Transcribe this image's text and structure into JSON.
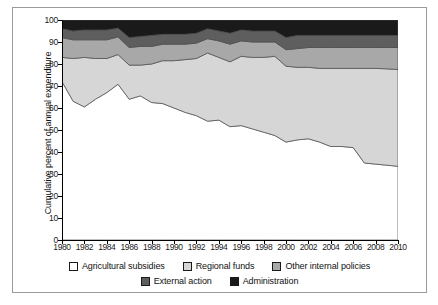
{
  "chart_data": {
    "type": "area",
    "stacked": true,
    "cumulative": true,
    "title": "",
    "xlabel": "",
    "ylabel": "Cumulative percent of annual expenditure",
    "ylim": [
      0,
      100
    ],
    "ytick_step": 10,
    "yticks": [
      0,
      10,
      20,
      30,
      40,
      50,
      60,
      70,
      80,
      90,
      100
    ],
    "xlim": [
      1980,
      2010
    ],
    "xtick_step": 2,
    "xticks": [
      1980,
      1982,
      1984,
      1986,
      1988,
      1990,
      1992,
      1994,
      1996,
      1998,
      2000,
      2002,
      2004,
      2006,
      2008,
      2010
    ],
    "grid": false,
    "legend_position": "bottom",
    "x": [
      1980,
      1981,
      1982,
      1983,
      1984,
      1985,
      1986,
      1987,
      1988,
      1989,
      1990,
      1991,
      1992,
      1993,
      1994,
      1995,
      1996,
      1997,
      1998,
      1999,
      2000,
      2001,
      2002,
      2003,
      2004,
      2005,
      2006,
      2007,
      2008,
      2009,
      2010
    ],
    "series": [
      {
        "name": "Agricultural subsidies",
        "color": "#ffffff",
        "values": [
          72.0,
          63.0,
          60.5,
          64.0,
          67.0,
          70.8,
          64.0,
          65.5,
          62.5,
          62.0,
          60.0,
          58.0,
          56.5,
          54.0,
          54.5,
          51.5,
          52.0,
          50.5,
          49.0,
          47.5,
          44.5,
          45.5,
          46.0,
          44.5,
          42.5,
          42.5,
          42.0,
          35.0,
          34.5,
          34.0,
          33.5
        ]
      },
      {
        "name": "Regional funds",
        "color": "#d6d6d6",
        "values": [
          11.0,
          19.5,
          22.5,
          18.5,
          15.5,
          13.5,
          15.5,
          14.0,
          17.5,
          19.5,
          21.5,
          24.0,
          26.0,
          31.0,
          28.5,
          29.5,
          31.5,
          32.5,
          34.0,
          36.0,
          34.5,
          33.0,
          32.5,
          33.5,
          35.5,
          35.5,
          36.0,
          43.0,
          43.5,
          43.8,
          44.0
        ]
      },
      {
        "name": "Other internal policies",
        "color": "#a8a8a8",
        "values": [
          9.0,
          8.5,
          8.0,
          8.5,
          8.5,
          8.0,
          8.0,
          8.5,
          8.0,
          7.5,
          7.5,
          7.0,
          7.0,
          6.5,
          7.5,
          8.0,
          7.0,
          7.0,
          7.0,
          6.5,
          7.5,
          8.5,
          9.0,
          9.5,
          9.5,
          9.5,
          9.5,
          9.5,
          9.5,
          9.7,
          10.0
        ]
      },
      {
        "name": "External action",
        "color": "#5e5e5e",
        "values": [
          4.0,
          4.0,
          4.5,
          4.5,
          4.5,
          4.0,
          4.5,
          4.5,
          5.0,
          4.5,
          4.5,
          4.5,
          4.5,
          4.5,
          4.5,
          5.0,
          5.0,
          5.0,
          5.0,
          5.0,
          5.5,
          6.0,
          5.5,
          5.5,
          5.5,
          5.5,
          5.5,
          5.5,
          5.5,
          5.5,
          5.5
        ]
      },
      {
        "name": "Administration",
        "color": "#1a1a1a",
        "values": [
          4.0,
          5.0,
          4.5,
          4.5,
          4.5,
          3.7,
          8.0,
          7.5,
          7.0,
          6.5,
          6.5,
          6.5,
          6.0,
          4.0,
          5.0,
          6.0,
          4.5,
          5.0,
          5.0,
          5.0,
          8.0,
          7.0,
          7.0,
          7.0,
          7.0,
          7.0,
          7.0,
          7.0,
          7.0,
          7.0,
          7.0
        ]
      }
    ],
    "cumulative_boundaries": {
      "agricultural_subsidies_top": [
        72.0,
        63.0,
        60.5,
        64.0,
        67.0,
        70.8,
        64.0,
        65.5,
        62.5,
        62.0,
        60.0,
        58.0,
        56.5,
        54.0,
        54.5,
        51.5,
        52.0,
        50.5,
        49.0,
        47.5,
        44.5,
        45.5,
        46.0,
        44.5,
        42.5,
        42.5,
        42.0,
        35.0,
        34.5,
        34.0,
        33.5
      ],
      "regional_funds_top": [
        83.0,
        82.5,
        83.0,
        82.5,
        82.5,
        84.3,
        79.5,
        79.5,
        80.0,
        81.5,
        81.5,
        82.0,
        82.5,
        85.0,
        83.0,
        81.0,
        83.5,
        83.0,
        83.0,
        83.5,
        79.0,
        78.5,
        78.5,
        78.0,
        78.0,
        78.0,
        78.0,
        78.0,
        78.0,
        77.8,
        77.5
      ],
      "other_internal_policies_top": [
        92.0,
        91.0,
        91.0,
        91.0,
        91.0,
        92.3,
        87.5,
        88.0,
        88.0,
        89.0,
        89.0,
        89.0,
        89.5,
        91.5,
        90.5,
        89.0,
        90.5,
        90.0,
        90.0,
        90.0,
        86.5,
        87.0,
        87.5,
        87.5,
        87.5,
        87.5,
        87.5,
        87.5,
        87.5,
        87.5,
        87.5
      ],
      "external_action_top": [
        96.0,
        95.0,
        95.5,
        95.5,
        95.5,
        96.3,
        92.0,
        92.5,
        93.0,
        93.5,
        93.5,
        93.5,
        94.0,
        96.0,
        95.0,
        94.0,
        95.5,
        95.0,
        95.0,
        95.0,
        92.0,
        93.0,
        93.0,
        93.0,
        93.0,
        93.0,
        93.0,
        93.0,
        93.0,
        93.0,
        93.0
      ],
      "administration_top": [
        100,
        100,
        100,
        100,
        100,
        100,
        100,
        100,
        100,
        100,
        100,
        100,
        100,
        100,
        100,
        100,
        100,
        100,
        100,
        100,
        100,
        100,
        100,
        100,
        100,
        100,
        100,
        100,
        100,
        100,
        100
      ]
    }
  },
  "axis": {
    "y_title": "Cumulative percent of annual expenditure"
  },
  "legend": {
    "rows": [
      [
        {
          "label": "Agricultural subsidies",
          "color": "#ffffff"
        },
        {
          "label": "Regional funds",
          "color": "#d6d6d6"
        },
        {
          "label": "Other internal policies",
          "color": "#a8a8a8"
        }
      ],
      [
        {
          "label": "External action",
          "color": "#5e5e5e"
        },
        {
          "label": "Administration",
          "color": "#1a1a1a"
        }
      ]
    ]
  }
}
